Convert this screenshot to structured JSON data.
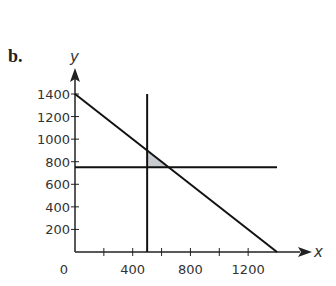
{
  "figure": {
    "label": "b."
  },
  "chart_data": {
    "type": "line",
    "title": "",
    "xlabel": "x",
    "ylabel": "y",
    "xlim": [
      0,
      1400
    ],
    "ylim": [
      0,
      1400
    ],
    "x_ticks": [
      200,
      400,
      600,
      800,
      1000,
      1200
    ],
    "x_tick_labels": [
      "0",
      "400",
      "800",
      "1200"
    ],
    "x_tick_label_values": [
      0,
      400,
      800,
      1200
    ],
    "y_ticks": [
      200,
      400,
      600,
      800,
      1000,
      1200,
      1400
    ],
    "y_tick_labels": [
      "200",
      "400",
      "600",
      "800",
      "1000",
      "1200",
      "1400"
    ],
    "grid": false,
    "series": [
      {
        "name": "x + y = 1400",
        "points": [
          [
            0,
            1400
          ],
          [
            1400,
            0
          ]
        ]
      },
      {
        "name": "y = 750",
        "points": [
          [
            0,
            750
          ],
          [
            1400,
            750
          ]
        ]
      },
      {
        "name": "x = 500",
        "points": [
          [
            500,
            0
          ],
          [
            500,
            1400
          ]
        ]
      }
    ],
    "shaded_region": {
      "vertices": [
        [
          500,
          900
        ],
        [
          500,
          750
        ],
        [
          650,
          750
        ]
      ],
      "color": "#c8ccd0"
    }
  }
}
